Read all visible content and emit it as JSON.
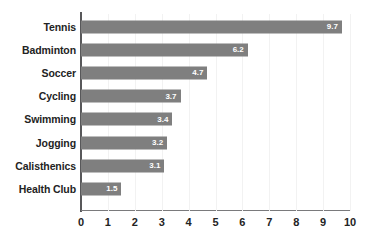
{
  "chart_data": {
    "type": "bar",
    "orientation": "horizontal",
    "title": "",
    "subtitle": "",
    "xlabel": "",
    "ylabel": "",
    "categories": [
      "Tennis",
      "Badminton",
      "Soccer",
      "Cycling",
      "Swimming",
      "Jogging",
      "Calisthenics",
      "Health Club"
    ],
    "values": [
      9.7,
      6.2,
      4.7,
      3.7,
      3.4,
      3.2,
      3.1,
      1.5
    ],
    "value_labels": [
      "9.7",
      "6.2",
      "4.7",
      "3.7",
      "3.4",
      "3.2",
      "3.1",
      "1.5"
    ],
    "xlim": [
      0,
      10
    ],
    "xticks": [
      0,
      1,
      2,
      3,
      4,
      5,
      6,
      7,
      8,
      9,
      10
    ],
    "xtick_labels": [
      "0",
      "1",
      "2",
      "3",
      "4",
      "5",
      "6",
      "7",
      "8",
      "9",
      "10"
    ],
    "grid": "faint-vertical",
    "legend": "none",
    "bar_color": "#7f7f7f",
    "value_label_color": "#ffffff",
    "axis_color": "#58585a",
    "tick_label_color": "#232323",
    "background_color": "#ffffff"
  }
}
